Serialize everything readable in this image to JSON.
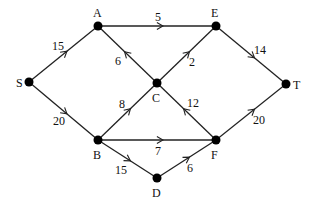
{
  "diagram": {
    "type": "directed-flow-network",
    "nodes": [
      {
        "id": "S",
        "label": "S",
        "x": 29,
        "y": 82,
        "lx": 16,
        "ly": 87
      },
      {
        "id": "A",
        "label": "A",
        "x": 98,
        "y": 26,
        "lx": 93,
        "ly": 17
      },
      {
        "id": "E",
        "label": "E",
        "x": 216,
        "y": 26,
        "lx": 211,
        "ly": 17
      },
      {
        "id": "C",
        "label": "C",
        "x": 157,
        "y": 83,
        "lx": 152,
        "ly": 102
      },
      {
        "id": "T",
        "label": "T",
        "x": 286,
        "y": 84,
        "lx": 293,
        "ly": 89
      },
      {
        "id": "B",
        "label": "B",
        "x": 98,
        "y": 140,
        "lx": 93,
        "ly": 159
      },
      {
        "id": "F",
        "label": "F",
        "x": 216,
        "y": 140,
        "lx": 211,
        "ly": 159
      },
      {
        "id": "D",
        "label": "D",
        "x": 157,
        "y": 178,
        "lx": 152,
        "ly": 197
      }
    ],
    "edges": [
      {
        "from": "S",
        "to": "A",
        "weight": "15",
        "lx": 52,
        "ly": 50
      },
      {
        "from": "S",
        "to": "B",
        "weight": "20",
        "lx": 53,
        "ly": 125
      },
      {
        "from": "A",
        "to": "E",
        "weight": "5",
        "lx": 155,
        "ly": 21
      },
      {
        "from": "C",
        "to": "A",
        "weight": "6",
        "lx": 115,
        "ly": 65
      },
      {
        "from": "C",
        "to": "E",
        "weight": "2",
        "lx": 189,
        "ly": 66
      },
      {
        "from": "E",
        "to": "T",
        "weight": "14",
        "lx": 254,
        "ly": 54
      },
      {
        "from": "B",
        "to": "C",
        "weight": "8",
        "lx": 119,
        "ly": 108
      },
      {
        "from": "F",
        "to": "C",
        "weight": "12",
        "lx": 187,
        "ly": 107
      },
      {
        "from": "B",
        "to": "F",
        "weight": "7",
        "lx": 155,
        "ly": 155
      },
      {
        "from": "B",
        "to": "D",
        "weight": "15",
        "lx": 115,
        "ly": 174
      },
      {
        "from": "D",
        "to": "F",
        "weight": "6",
        "lx": 187,
        "ly": 172
      },
      {
        "from": "F",
        "to": "T",
        "weight": "20",
        "lx": 253,
        "ly": 124
      }
    ]
  }
}
